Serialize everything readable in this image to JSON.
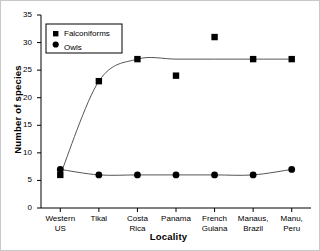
{
  "chart_data": {
    "type": "line",
    "title": "",
    "xlabel": "Locality",
    "ylabel": "Number of species",
    "categories": [
      "Western\nUS",
      "Tikal",
      "Costa\nRica",
      "Panama",
      "French\nGuiana",
      "Manaus,\nBrazil",
      "Manu,\nPeru"
    ],
    "category_lines": [
      [
        "Western",
        "US"
      ],
      [
        "Tikal",
        ""
      ],
      [
        "Costa",
        "Rica"
      ],
      [
        "Panama",
        ""
      ],
      [
        "French",
        "Guiana"
      ],
      [
        "Manaus,",
        "Brazil"
      ],
      [
        "Manu,",
        "Peru"
      ]
    ],
    "ylim": [
      0,
      35
    ],
    "yticks": [
      0,
      5,
      10,
      15,
      20,
      25,
      30,
      35
    ],
    "ytick_labels": [
      "0",
      "5",
      "10",
      "15",
      "20",
      "25",
      "30",
      "35"
    ],
    "grid": false,
    "legend_position": "upper-left",
    "series": [
      {
        "name": "Falconiforms",
        "marker": "square",
        "color": "#000000",
        "values": [
          6,
          23,
          27,
          24,
          31,
          27,
          27
        ],
        "fitted_curve": [
          6,
          23,
          27,
          27,
          27,
          27,
          27
        ]
      },
      {
        "name": "Owls",
        "marker": "circle",
        "color": "#000000",
        "values": [
          7,
          6,
          6,
          6,
          6,
          6,
          7
        ],
        "fitted_curve": [
          7,
          6,
          6,
          6,
          6,
          6,
          7
        ]
      }
    ]
  },
  "legend": {
    "entries": [
      {
        "label": "Falconiforms",
        "marker": "square-marker-icon"
      },
      {
        "label": "Owls",
        "marker": "circle-marker-icon"
      }
    ]
  }
}
